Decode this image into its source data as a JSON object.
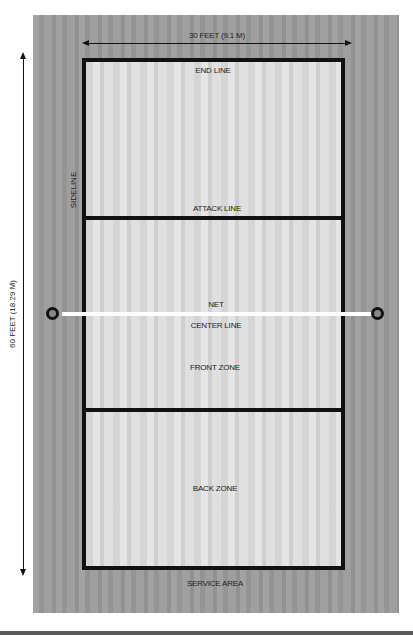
{
  "diagram": {
    "dimensions": {
      "width_label": "30 FEET (9.1 M)",
      "length_label": "60 FEET (18.29 M)"
    },
    "labels": {
      "end_line": "END LINE",
      "sideline": "SIDELINE",
      "attack_line": "ATTACK LINE",
      "net": "NET",
      "center_line": "CENTER LINE",
      "front_zone": "FRONT ZONE",
      "back_zone": "BACK ZONE",
      "service_area": "SERVICE AREA"
    },
    "colors": {
      "court_surface": "#dcdcdc",
      "surround": "#9c9c9c",
      "lines": "#111111",
      "net": "#ffffff"
    }
  }
}
